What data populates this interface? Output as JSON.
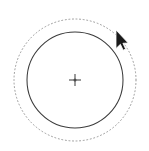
{
  "canvas": {
    "width": 149,
    "height": 151,
    "background_color": "#ffffff",
    "label": "vector drawing canvas"
  },
  "shapes": {
    "selection_halo": {
      "name": "dotted selection ring",
      "type": "circle",
      "center_x": 75,
      "center_y": 80,
      "radius": 61,
      "stroke_color": "#9a9a9a",
      "stroke_width": 1,
      "stroke_style": "dotted",
      "fill": "none"
    },
    "main_circle": {
      "name": "circle path",
      "type": "circle",
      "center_x": 75,
      "center_y": 80,
      "radius": 48,
      "stroke_color": "#3b3b3b",
      "stroke_width": 1,
      "stroke_style": "solid",
      "fill": "none"
    },
    "center_marker": {
      "name": "center origin crosshair",
      "type": "cross",
      "center_x": 75,
      "center_y": 80,
      "arm_length": 6,
      "stroke_color": "#4a4a4a",
      "stroke_width": 1
    }
  },
  "cursor": {
    "name": "arrow pointer",
    "type": "arrow",
    "tip_x": 116,
    "tip_y": 30,
    "fill_color": "#1a1a1a",
    "outline_color": "#ffffff"
  }
}
